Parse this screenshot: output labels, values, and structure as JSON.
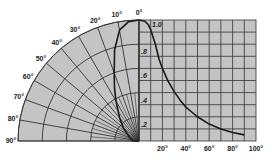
{
  "chart_data": [
    {
      "type": "line",
      "subtype": "polar",
      "title": "",
      "angular_axis": {
        "range_deg": [
          0,
          90
        ],
        "tick_labels": [
          "0°",
          "10°",
          "20°",
          "30°",
          "40°",
          "50°",
          "60°",
          "70°",
          "80°",
          "90°"
        ]
      },
      "radial_axis": {
        "range": [
          0,
          1.0
        ],
        "rings": [
          0.2,
          0.4,
          0.6,
          0.8,
          1.0
        ]
      },
      "series": [
        {
          "name": "relative intensity (polar)",
          "theta_deg": [
            0,
            5,
            10,
            15,
            20,
            25,
            30,
            40,
            50,
            60,
            70,
            80,
            90
          ],
          "r": [
            1.0,
            0.99,
            0.93,
            0.78,
            0.6,
            0.48,
            0.38,
            0.25,
            0.17,
            0.11,
            0.08,
            0.06,
            0.05
          ]
        }
      ]
    },
    {
      "type": "line",
      "title": "",
      "xlabel": "",
      "ylabel": "",
      "x_tick_labels": [
        "20°",
        "40°",
        "60°",
        "80°",
        "100°"
      ],
      "y_tick_labels": [
        "1.0",
        ".8",
        ".6",
        ".4",
        ".2"
      ],
      "xlim": [
        0,
        100
      ],
      "ylim": [
        0,
        1.0
      ],
      "grid": true,
      "series": [
        {
          "name": "relative intensity (cartesian)",
          "x": [
            0,
            5,
            8,
            10,
            12,
            14,
            17,
            20,
            25,
            30,
            35,
            40,
            45,
            50,
            60,
            70,
            80,
            90
          ],
          "y": [
            1.0,
            0.99,
            0.96,
            0.92,
            0.86,
            0.8,
            0.68,
            0.6,
            0.49,
            0.41,
            0.34,
            0.28,
            0.24,
            0.2,
            0.14,
            0.1,
            0.07,
            0.05
          ]
        }
      ]
    }
  ],
  "colors": {
    "panel": "#c4c4c4",
    "grid": "#333333",
    "curve": "#1a1a1a"
  }
}
